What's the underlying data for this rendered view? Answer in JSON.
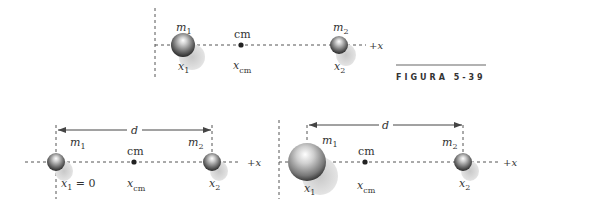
{
  "figure": {
    "caption": "FIGURA 5-39"
  },
  "panels": [
    {
      "id": "top",
      "mass1": {
        "label": "m",
        "sub": "1",
        "pos_label": "x",
        "pos_sub": "1"
      },
      "mass2": {
        "label": "m",
        "sub": "2",
        "pos_label": "x",
        "pos_sub": "2"
      },
      "cm": {
        "label": "cm",
        "pos_label": "x",
        "pos_sub": "cm"
      },
      "axis_label": "+x"
    },
    {
      "id": "bottom-left",
      "distance_label": "d",
      "mass1": {
        "label": "m",
        "sub": "1",
        "pos_label": "x",
        "pos_sub": "1",
        "pos_value": " = 0"
      },
      "mass2": {
        "label": "m",
        "sub": "2",
        "pos_label": "x",
        "pos_sub": "2"
      },
      "cm": {
        "label": "cm",
        "pos_label": "x",
        "pos_sub": "cm"
      },
      "axis_label": "+x"
    },
    {
      "id": "bottom-right",
      "distance_label": "d",
      "mass1": {
        "label": "m",
        "sub": "1",
        "pos_label": "x",
        "pos_sub": "1"
      },
      "mass2": {
        "label": "m",
        "sub": "2",
        "pos_label": "x",
        "pos_sub": "2"
      },
      "cm": {
        "label": "cm",
        "pos_label": "x",
        "pos_sub": "cm"
      },
      "axis_label": "+x"
    }
  ]
}
